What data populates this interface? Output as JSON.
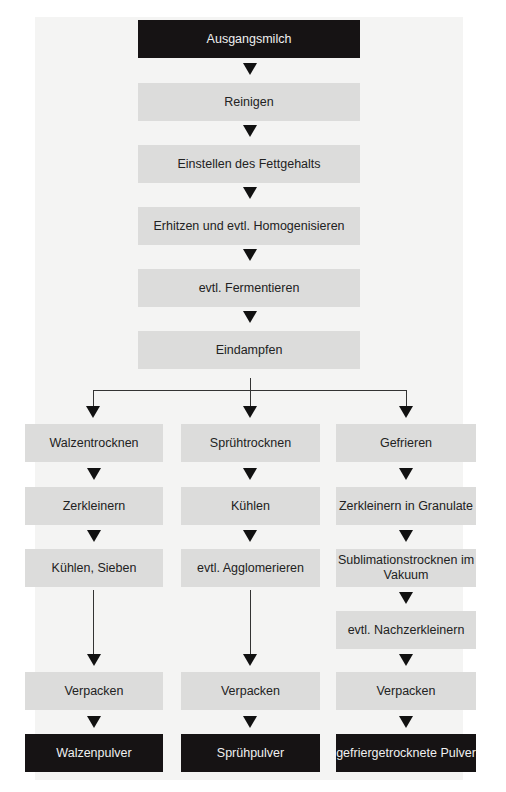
{
  "diagram": {
    "start": "Ausgangsmilch",
    "main_steps": [
      "Reinigen",
      "Einstellen des Fettgehalts",
      "Erhitzen und evtl. Homogenisieren",
      "evtl. Fermentieren",
      "Eindampfen"
    ],
    "branches": [
      {
        "name": "Walzentrocknung",
        "steps": [
          "Walzentrocknen",
          "Zerkleinern",
          "Kühlen, Sieben",
          "Verpacken"
        ],
        "result": "Walzenpulver"
      },
      {
        "name": "Sprühtrocknung",
        "steps": [
          "Sprühtrocknen",
          "Kühlen",
          "evtl. Agglomerieren",
          "Verpacken"
        ],
        "result": "Sprühpulver"
      },
      {
        "name": "Gefriertrocknung",
        "steps": [
          "Gefrieren",
          "Zerkleinern in Granulate",
          "Sublimationstrocknen im Vakuum",
          "evtl. Nachzerkleinern",
          "Verpacken"
        ],
        "result": "gefriergetrocknete Pulver"
      }
    ],
    "colors": {
      "dark_box": "#161314",
      "gray_box": "#dcdcdb",
      "panel": "#f4f4f3",
      "arrow": "#111111"
    }
  }
}
